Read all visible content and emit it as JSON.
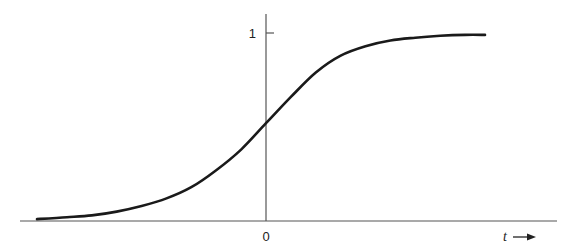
{
  "chart_data": {
    "type": "line",
    "title": "",
    "xlabel": "t",
    "ylabel": "",
    "x_arrow": true,
    "grid": false,
    "legend": "none",
    "xlim": [
      -4.6,
      4.4
    ],
    "ylim": [
      0,
      1.05
    ],
    "x_ticks": [
      {
        "value": 0,
        "label": "0"
      }
    ],
    "y_ticks": [
      {
        "value": 1,
        "label": "1"
      }
    ],
    "series": [
      {
        "name": "sigmoid",
        "description": "S-shaped curve rising from near 0 to a plateau at 1, crossing about 0.5 at t = 0",
        "x": [
          -4.6,
          -4.0,
          -3.5,
          -3.0,
          -2.5,
          -2.0,
          -1.5,
          -1.0,
          -0.5,
          0.0,
          0.5,
          1.0,
          1.5,
          2.0,
          2.5,
          3.0,
          3.5,
          4.0,
          4.4
        ],
        "y": [
          0.01,
          0.02,
          0.03,
          0.05,
          0.08,
          0.12,
          0.18,
          0.27,
          0.38,
          0.52,
          0.66,
          0.79,
          0.88,
          0.93,
          0.96,
          0.975,
          0.985,
          0.99,
          0.99
        ]
      }
    ]
  }
}
